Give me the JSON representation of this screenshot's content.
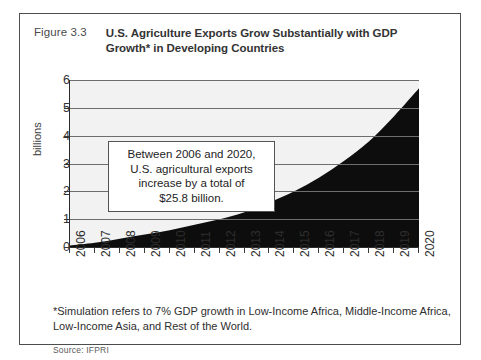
{
  "figure": {
    "number": "Figure 3.3",
    "title": "U.S. Agriculture Exports Grow Substantially with GDP Growth* in Developing Countries",
    "footnote": "*Simulation refers to 7% GDP growth in Low-Income Africa, Middle-Income Africa, Low-Income Asia, and Rest of the World.",
    "source": "Source: IFPRI"
  },
  "callout": {
    "line1": "Between 2006 and 2020,",
    "line2": "U.S. agricultural exports",
    "line3": "increase by a total of",
    "line4": "$25.8 billion."
  },
  "colors": {
    "area_fill": "#0d0d0d",
    "plot_background": "#f2f2f2",
    "gridline": "#6e6e6e",
    "axis": "#2b2b2b",
    "frame": "#4d4d4d"
  },
  "chart_data": {
    "type": "area",
    "title": "U.S. Agriculture Exports Grow Substantially with GDP Growth* in Developing Countries",
    "xlabel": "",
    "ylabel": "billions",
    "categories": [
      "2006",
      "2007",
      "2008",
      "2009",
      "2010",
      "2011",
      "2012",
      "2013",
      "2014",
      "2015",
      "2016",
      "2017",
      "2018",
      "2019",
      "2020"
    ],
    "x": [
      2006,
      2007,
      2008,
      2009,
      2010,
      2011,
      2012,
      2013,
      2014,
      2015,
      2016,
      2017,
      2018,
      2019,
      2020
    ],
    "values": [
      0.05,
      0.15,
      0.3,
      0.45,
      0.6,
      0.8,
      1.0,
      1.25,
      1.6,
      2.0,
      2.5,
      3.1,
      3.8,
      4.7,
      5.7
    ],
    "ylim": [
      0,
      6
    ],
    "yticks": [
      0,
      1,
      2,
      3,
      4,
      5,
      6
    ],
    "ytick_labels": [
      "0",
      "1",
      "2",
      "3",
      "4",
      "5",
      "6"
    ],
    "grid": true,
    "legend": "none",
    "annotations": [
      "Between 2006 and 2020, U.S. agricultural exports increase by a total of $25.8 billion."
    ]
  }
}
